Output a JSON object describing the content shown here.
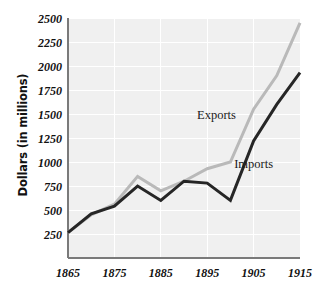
{
  "chart_data": {
    "type": "line",
    "title": "",
    "xlabel": "",
    "ylabel": "Dollars (in millions)",
    "xlim": [
      1865,
      1915
    ],
    "ylim": [
      0,
      2500
    ],
    "grid": true,
    "legend_position": "inline-annotation",
    "x": [
      1865,
      1870,
      1875,
      1880,
      1885,
      1890,
      1895,
      1900,
      1905,
      1910,
      1915
    ],
    "xticks": [
      "1865",
      "1875",
      "1885",
      "1895",
      "1905",
      "1915"
    ],
    "xtick_values": [
      1865,
      1875,
      1885,
      1895,
      1905,
      1915
    ],
    "yticks": [
      "250",
      "500",
      "750",
      "1000",
      "1250",
      "1500",
      "1750",
      "2000",
      "2250",
      "2500"
    ],
    "ytick_values": [
      250,
      500,
      750,
      1000,
      1250,
      1500,
      1750,
      2000,
      2250,
      2500
    ],
    "series": [
      {
        "name": "Exports",
        "color": "#b9b9b9",
        "values": [
          265,
          450,
          560,
          850,
          700,
          800,
          930,
          1000,
          1550,
          1900,
          2450
        ],
        "label_x": 1897,
        "label_y": 1450
      },
      {
        "name": "Imports",
        "color": "#262626",
        "values": [
          265,
          460,
          540,
          750,
          600,
          800,
          780,
          600,
          1220,
          1600,
          1930
        ],
        "label_x": 1905,
        "label_y": 940
      }
    ]
  },
  "annotations": {
    "exports_label": "Exports",
    "imports_label": "Imports"
  },
  "axes": {
    "y_title": "Dollars (in millions)"
  }
}
